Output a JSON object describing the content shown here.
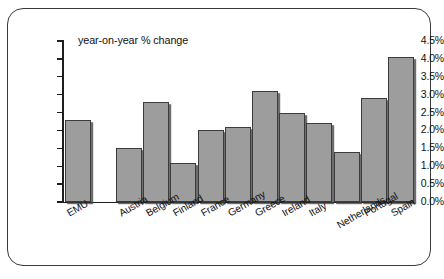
{
  "chart_data": {
    "type": "bar",
    "title": "year-on-year % change",
    "xlabel": "",
    "ylabel": "",
    "ylim": [
      0,
      4.5
    ],
    "ytick_step": 0.5,
    "grid": false,
    "legend": null,
    "categories": [
      "EMU",
      "Austria",
      "Belgium",
      "Finland",
      "France",
      "Germany",
      "Greece",
      "Ireland",
      "Italy",
      "Netherlands",
      "Portugal",
      "Spain"
    ],
    "values": [
      2.3,
      1.5,
      2.8,
      1.1,
      2.0,
      2.1,
      3.1,
      2.5,
      2.2,
      1.4,
      2.9,
      4.05
    ],
    "ytick_labels": [
      "0.0%",
      "0.5%",
      "1.0%",
      "1.5%",
      "2.0%",
      "2.5%",
      "3.0%",
      "3.5%",
      "4.0%",
      "4.5%"
    ],
    "bar_color": "#9d9d9d",
    "bar_border_color": "#3c3c3c",
    "axis_color": "#1e1e1e",
    "frame_color": "#3a3a3a",
    "background": "#ffffff"
  }
}
